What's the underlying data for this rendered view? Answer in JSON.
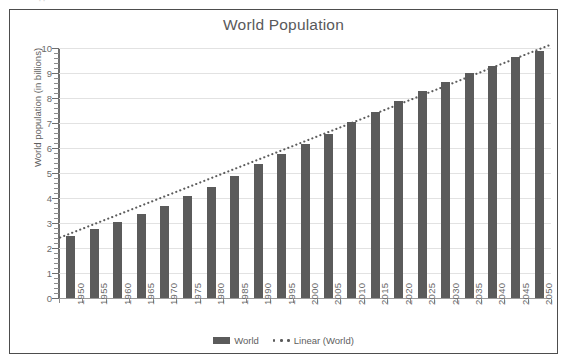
{
  "top_artifact": "··",
  "chart_data": {
    "type": "bar",
    "title": "World Population",
    "xlabel": "",
    "ylabel": "World population (in billions)",
    "ylim": [
      0,
      10
    ],
    "ytick_step": 1,
    "yticks": [
      "0",
      "1",
      "2",
      "3",
      "4",
      "5",
      "6",
      "7",
      "8",
      "9",
      "10"
    ],
    "grid": true,
    "legend_position": "bottom",
    "categories": [
      "1950",
      "1955",
      "1960",
      "1965",
      "1970",
      "1975",
      "1980",
      "1985",
      "1990",
      "1995",
      "2000",
      "2005",
      "2010",
      "2015",
      "2020",
      "2025",
      "2030",
      "2035",
      "2040",
      "2045",
      "2050"
    ],
    "series": [
      {
        "name": "World",
        "kind": "bar",
        "color": "#5b5b5b",
        "values": [
          2.5,
          2.75,
          3.05,
          3.35,
          3.7,
          4.1,
          4.45,
          4.9,
          5.35,
          5.75,
          6.15,
          6.55,
          7.05,
          7.45,
          7.9,
          8.3,
          8.65,
          9.0,
          9.3,
          9.65,
          9.9
        ]
      },
      {
        "name": "Linear (World)",
        "kind": "trendline-dotted",
        "color": "#5b5b5b",
        "start_value": 2.42,
        "end_value": 10.12
      }
    ],
    "legend": [
      "World",
      "Linear (World)"
    ]
  },
  "colors": {
    "bar": "#5b5b5b",
    "gridline": "#e2e2e2",
    "axis": "#6f6f6f",
    "frame": "#4d4d4d",
    "title_text": "#59595b",
    "tick_text": "#6b6b6b"
  }
}
